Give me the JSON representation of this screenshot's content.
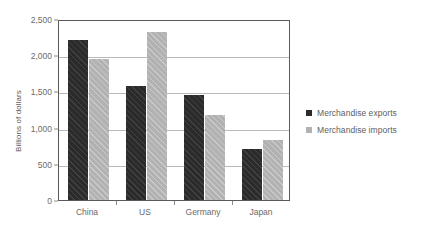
{
  "chart_data": {
    "type": "bar",
    "title": "",
    "subtitle": "",
    "xlabel": "",
    "ylabel": "Billions of dollars",
    "categories": [
      "China",
      "US",
      "Germany",
      "Japan"
    ],
    "series": [
      {
        "name": "Merchandise exports",
        "color": "#2b2b2b",
        "values": [
          2210,
          1580,
          1450,
          710
        ]
      },
      {
        "name": "Merchandise imports",
        "color": "#b2b2b2",
        "values": [
          1950,
          2320,
          1180,
          830
        ]
      }
    ],
    "ylim": [
      0,
      2500
    ],
    "ytick_values": [
      0,
      500,
      1000,
      1500,
      2000,
      2500
    ],
    "ytick_labels": [
      "0",
      "500",
      "1,000",
      "1,500",
      "2,000",
      "2,500"
    ],
    "grid": true,
    "legend_position": "right"
  },
  "legend": {
    "items": [
      {
        "label": "Merchandise exports"
      },
      {
        "label": "Merchandise imports"
      }
    ]
  }
}
